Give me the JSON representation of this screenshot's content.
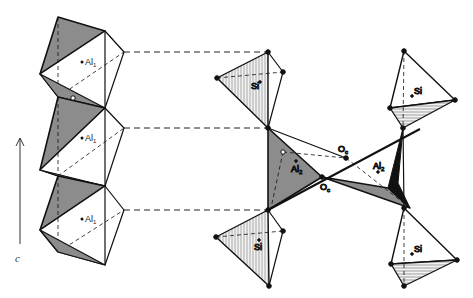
{
  "figure": {
    "type": "crystal-structure-polyhedra",
    "axis": {
      "label": "c",
      "direction": "up"
    },
    "colors": {
      "shaded_face": "#8c8c8c",
      "hatched_face": "#d8d8d8",
      "line": "#111111",
      "background": "#ffffff"
    },
    "left_chain": {
      "description": "edge-sharing AlO6 octahedra chain parallel to c",
      "octahedra": [
        {
          "label": "Al",
          "subscript": "1"
        },
        {
          "label": "Al",
          "subscript": "1"
        },
        {
          "label": "Al",
          "subscript": "1"
        }
      ]
    },
    "middle_group": {
      "tetrahedra": [
        {
          "label": "Si",
          "position": "top"
        },
        {
          "label": "Si",
          "position": "bottom"
        }
      ],
      "polyhedron": {
        "label": "Al",
        "subscript": "2"
      },
      "oxygens": [
        {
          "label": "O",
          "subscript": "c",
          "position": "upper"
        },
        {
          "label": "O",
          "subscript": "c",
          "position": "lower"
        }
      ]
    },
    "right_group": {
      "tetrahedra": [
        {
          "label": "Si",
          "position": "top"
        },
        {
          "label": "Si",
          "position": "bottom"
        }
      ],
      "polyhedron": {
        "label": "Al",
        "subscript": "2"
      }
    }
  }
}
